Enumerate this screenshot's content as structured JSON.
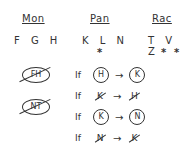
{
  "groups": [
    {
      "name": "Mon",
      "members": "F G H",
      "starred": []
    },
    {
      "name": "Pan",
      "members": "K L N",
      "starred": [
        "L"
      ]
    },
    {
      "name": "Rac",
      "members": "T V Z",
      "starred": [
        "V",
        "Z"
      ]
    }
  ],
  "star_symbol": "*",
  "banned_pairs": [
    "FH",
    "NT"
  ],
  "rules": [
    {
      "if": "If",
      "antecedent": "H",
      "antecedent_negated": false,
      "arrow": "→",
      "consequent": "K",
      "consequent_negated": false
    },
    {
      "if": "If",
      "antecedent": "K",
      "antecedent_negated": true,
      "arrow": "→",
      "consequent": "H",
      "consequent_negated": true
    },
    {
      "if": "If",
      "antecedent": "K",
      "antecedent_negated": false,
      "arrow": "→",
      "consequent": "N",
      "consequent_negated": false
    },
    {
      "if": "If",
      "antecedent": "N",
      "antecedent_negated": true,
      "arrow": "→",
      "consequent": "K",
      "consequent_negated": true
    }
  ]
}
